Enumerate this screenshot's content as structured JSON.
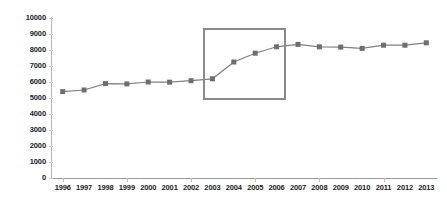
{
  "chart_data": {
    "type": "line",
    "title": "",
    "subtitle": "",
    "xlabel": "",
    "ylabel": "",
    "grid": false,
    "legend": null,
    "legend_position": "none",
    "ylim": [
      0,
      10000
    ],
    "ytick_step": 1000,
    "yticks": [
      "10000",
      "9000",
      "8000",
      "7000",
      "6000",
      "5000",
      "4000",
      "3000",
      "2000",
      "1000",
      "0"
    ],
    "categories": [
      "1996",
      "1997",
      "1998",
      "1999",
      "2000",
      "2001",
      "2002",
      "2003",
      "2004",
      "2005",
      "2006",
      "2007",
      "2008",
      "2009",
      "2010",
      "2011",
      "2012",
      "2013"
    ],
    "values": [
      5400,
      5500,
      5900,
      5880,
      6000,
      5990,
      6080,
      6200,
      7250,
      7800,
      8200,
      8350,
      8200,
      8180,
      8100,
      8300,
      8300,
      8450
    ],
    "series": [
      {
        "name": "series-1",
        "marker": "square",
        "line_color": "#808080",
        "marker_color": "#6e6e6e",
        "values": [
          5400,
          5500,
          5900,
          5880,
          6000,
          5990,
          6080,
          6200,
          7250,
          7800,
          8200,
          8350,
          8200,
          8180,
          8100,
          8300,
          8300,
          8450
        ]
      }
    ],
    "annotations": [
      {
        "type": "rectangle",
        "name": "highlight-box",
        "x_start": "2003",
        "x_end": "2006",
        "y_start": 4900,
        "y_end": 9400,
        "color": "#8a8a8a"
      }
    ]
  },
  "colors": {
    "line": "#808080",
    "marker": "#6e6e6e",
    "highlight": "#8a8a8a",
    "axis": "#b0b0b0",
    "text": "#1a1a1a",
    "background": "#ffffff"
  }
}
